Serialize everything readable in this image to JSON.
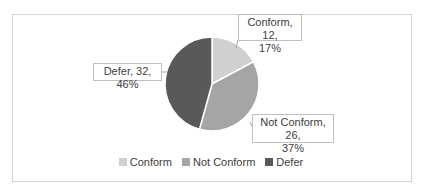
{
  "chart_data": {
    "type": "pie",
    "title": "",
    "categories": [
      "Conform",
      "Not Conform",
      "Defer"
    ],
    "values": [
      12,
      26,
      32
    ],
    "percentages": [
      17,
      37,
      46
    ],
    "colors": [
      "#d0d0d0",
      "#a5a5a5",
      "#595959"
    ],
    "data_labels": [
      {
        "line1": "Conform, 12,",
        "line2": "17%"
      },
      {
        "line1": "Not Conform, 26,",
        "line2": "37%"
      },
      {
        "line1": "Defer, 32, 46%",
        "line2": ""
      }
    ],
    "legend": {
      "position": "bottom",
      "entries": [
        "Conform",
        "Not Conform",
        "Defer"
      ]
    }
  }
}
